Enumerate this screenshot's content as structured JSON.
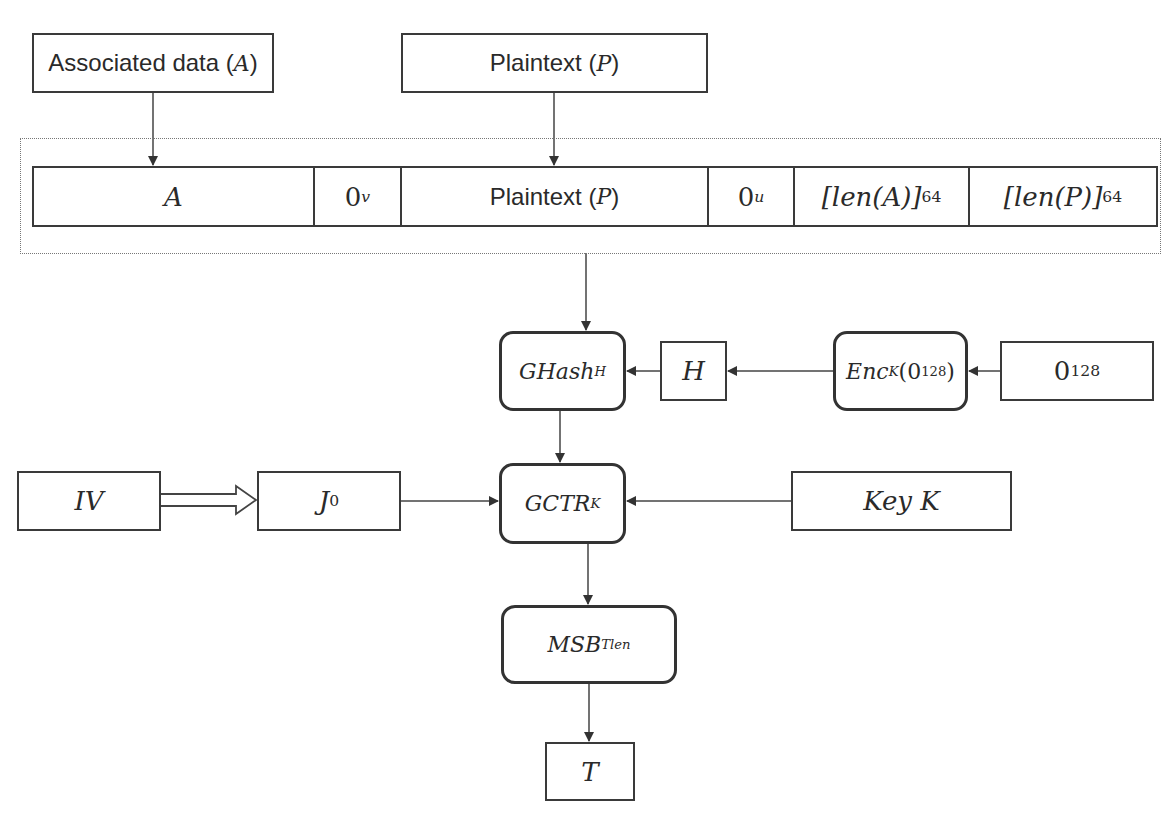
{
  "diagram": {
    "title": "",
    "inputs": {
      "associated_data": {
        "label": "Associated data",
        "symbol": "A"
      },
      "plaintext": {
        "label": "Plaintext",
        "symbol": "P"
      }
    },
    "concatenation": {
      "cells": [
        {
          "id": "A",
          "text": "A"
        },
        {
          "id": "pad_v",
          "base": "0",
          "sup": "v"
        },
        {
          "id": "plaintext",
          "label": "Plaintext",
          "symbol": "P"
        },
        {
          "id": "pad_u",
          "base": "0",
          "sup": "u"
        },
        {
          "id": "len_a",
          "text": "[len(A)]",
          "sub": "64"
        },
        {
          "id": "len_p",
          "text": "[len(P)]",
          "sub": "64"
        }
      ]
    },
    "nodes": {
      "ghash": {
        "base": "GHash",
        "sub": "H"
      },
      "h": {
        "text": "H"
      },
      "enc": {
        "base": "Enc",
        "sub": "K",
        "arg_open": "(",
        "arg_base": "0",
        "arg_sup": "128",
        "arg_close": ")"
      },
      "zero128": {
        "base": "0",
        "sup": "128"
      },
      "iv": {
        "text": "IV"
      },
      "j0": {
        "base": "J",
        "sub": "0"
      },
      "gctr": {
        "base": "GCTR",
        "sub": "K"
      },
      "key": {
        "text": "Key K"
      },
      "msb": {
        "base": "MSB",
        "sub": "Tlen"
      },
      "tag": {
        "text": "T"
      }
    },
    "edges": [
      {
        "from": "associated_data",
        "to": "A"
      },
      {
        "from": "plaintext_input",
        "to": "plaintext_cell"
      },
      {
        "from": "concatenation",
        "to": "ghash"
      },
      {
        "from": "zero128",
        "to": "enc"
      },
      {
        "from": "enc",
        "to": "h"
      },
      {
        "from": "h",
        "to": "ghash"
      },
      {
        "from": "ghash",
        "to": "gctr"
      },
      {
        "from": "iv",
        "to": "j0",
        "style": "hollow-arrow"
      },
      {
        "from": "j0",
        "to": "gctr"
      },
      {
        "from": "key",
        "to": "gctr"
      },
      {
        "from": "gctr",
        "to": "msb"
      },
      {
        "from": "msb",
        "to": "tag"
      }
    ],
    "colors": {
      "stroke": "#333333",
      "frame": "#777777",
      "background": "#ffffff"
    }
  }
}
